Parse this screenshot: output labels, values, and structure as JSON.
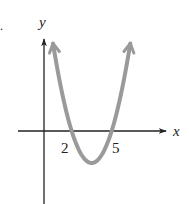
{
  "chart_data": {
    "type": "line",
    "title": "",
    "xlabel": "x",
    "ylabel": "y",
    "x_tick_labels": [
      "2",
      "5"
    ],
    "x_ticks": [
      2,
      5
    ],
    "series": [
      {
        "name": "parabola",
        "description": "Upward-opening parabola with x-intercepts at 2 and 5, arrows at both ends",
        "x_intercepts": [
          2,
          5
        ],
        "vertex": {
          "x": 3.5,
          "y": -2.4
        },
        "equation_form": "y = a(x - 2)(x - 5), a > 0",
        "color": "#9a9a9a",
        "x": [
          0.6,
          1.0,
          1.5,
          2.0,
          2.5,
          3.0,
          3.5,
          4.0,
          4.5,
          5.0,
          5.5,
          6.0,
          6.4
        ],
        "values": [
          6.6,
          4.3,
          2.0,
          0.0,
          -1.6,
          -2.1,
          -2.4,
          -2.1,
          -1.6,
          0.0,
          2.0,
          4.3,
          6.6
        ]
      }
    ],
    "axes": {
      "x_axis_color": "#222222",
      "y_axis_color": "#222222",
      "grid": false
    },
    "legend": null
  },
  "labels": {
    "x_axis": "x",
    "y_axis": "y",
    "tick_2": "2",
    "tick_5": "5",
    "marker": "."
  }
}
